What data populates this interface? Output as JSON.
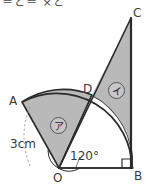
{
  "figure": {
    "type": "geometry-diagram",
    "top_cut_text": "＝と＝ ×と",
    "colors": {
      "shaded_fill": "#b9b9b9",
      "unshaded_fill": "#ffffff",
      "stroke": "#2b2b2b",
      "dashed_guide": "#9a9a9a",
      "label_text": "#3a3a3a"
    },
    "vertices": [
      {
        "name": "A",
        "label": "A",
        "x": 22,
        "y": 102
      },
      {
        "name": "B",
        "label": "B",
        "x": 132,
        "y": 168
      },
      {
        "name": "C",
        "label": "C",
        "x": 131,
        "y": 18
      },
      {
        "name": "D",
        "label": "D",
        "x": 92,
        "y": 95
      },
      {
        "name": "O",
        "label": "O",
        "x": 59,
        "y": 168
      }
    ],
    "measurements": {
      "radius_label": "3cm",
      "angle_label": "120°",
      "right_angle_at": "B"
    },
    "regions": [
      {
        "name": "region-a",
        "label": "ア",
        "description": "shaded sector A-O-D"
      },
      {
        "name": "region-i",
        "label": "イ",
        "description": "shaded triangle O-C-B minus arc"
      }
    ]
  }
}
